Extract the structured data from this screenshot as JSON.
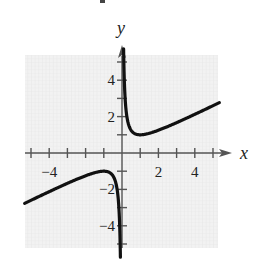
{
  "chart_data": {
    "type": "line",
    "title": "",
    "function": "y = x/2 + 1/(2x)",
    "xlabel": "x",
    "ylabel": "y",
    "xlim": [
      -5.4,
      5.4
    ],
    "ylim": [
      -5.4,
      5.4
    ],
    "x_ticks": [
      -5,
      -4,
      -3,
      -2,
      -1,
      1,
      2,
      3,
      4,
      5
    ],
    "y_ticks": [
      -5,
      -4,
      -3,
      -2,
      -1,
      1,
      2,
      3,
      4,
      5
    ],
    "x_tick_labels": [
      {
        "value": -4,
        "label": "−4"
      },
      {
        "value": 2,
        "label": "2"
      },
      {
        "value": 4,
        "label": "4"
      }
    ],
    "y_tick_labels": [
      {
        "value": 4,
        "label": "4"
      },
      {
        "value": 2,
        "label": "2"
      },
      {
        "value": -2,
        "label": "−2"
      },
      {
        "value": -4,
        "label": "−4"
      }
    ],
    "grid": true,
    "legend": null,
    "series": [
      {
        "name": "right branch",
        "x": [
          0.09,
          0.1,
          0.12,
          0.15,
          0.2,
          0.3,
          0.5,
          0.75,
          1,
          1.5,
          2,
          3,
          4,
          5,
          5.3
        ],
        "y": [
          5.6,
          5.05,
          4.23,
          3.41,
          2.6,
          1.82,
          1.25,
          1.04,
          1.0,
          1.08,
          1.25,
          1.67,
          2.13,
          2.6,
          2.74
        ]
      },
      {
        "name": "left branch",
        "x": [
          -0.09,
          -0.1,
          -0.12,
          -0.15,
          -0.2,
          -0.3,
          -0.5,
          -0.75,
          -1,
          -1.5,
          -2,
          -3,
          -4,
          -5,
          -5.3
        ],
        "y": [
          -5.6,
          -5.05,
          -4.23,
          -3.41,
          -2.6,
          -1.82,
          -1.25,
          -1.04,
          -1.0,
          -1.08,
          -1.25,
          -1.67,
          -2.13,
          -2.6,
          -2.74
        ]
      }
    ],
    "asymptotes": {
      "vertical": "x = 0",
      "slant": "y = x/2"
    }
  },
  "labels": {
    "x_axis": "x",
    "y_axis": "y"
  }
}
